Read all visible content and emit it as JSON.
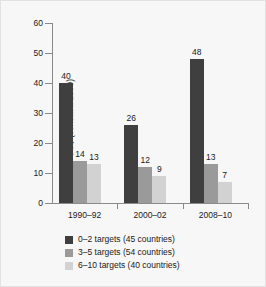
{
  "chart_data": {
    "type": "bar",
    "title": "",
    "xlabel": "",
    "ylabel": "US$ (constant 2009)",
    "ylim": [
      0,
      60
    ],
    "ytick_step": 10,
    "yticks": [
      "60",
      "50",
      "40",
      "30",
      "20",
      "10",
      "0"
    ],
    "grid": false,
    "legend_position": "bottom-center",
    "categories": [
      "1990–92",
      "2000–02",
      "2008–10"
    ],
    "series": [
      {
        "name": "0–2 targets (45 countries)",
        "color": "#3f3f3f",
        "values": [
          40,
          26,
          48
        ],
        "labels": [
          "40",
          "26",
          "48"
        ]
      },
      {
        "name": "3–5 targets (54 countries)",
        "color": "#9a9a9a",
        "values": [
          14,
          12,
          13
        ],
        "labels": [
          "14",
          "12",
          "13"
        ]
      },
      {
        "name": "6–10 targets (40 countries)",
        "color": "#d2d2d2",
        "values": [
          13,
          9,
          7
        ],
        "labels": [
          "13",
          "9",
          "7"
        ]
      }
    ]
  },
  "axis": {
    "y_title": "US$ (constant 2009)"
  },
  "colors": {
    "axis": "#8a8a8a",
    "text": "#1a1a1a",
    "background": "#f7f7f7",
    "series_1": "#3f3f3f",
    "series_2": "#9a9a9a",
    "series_3": "#d2d2d2"
  }
}
